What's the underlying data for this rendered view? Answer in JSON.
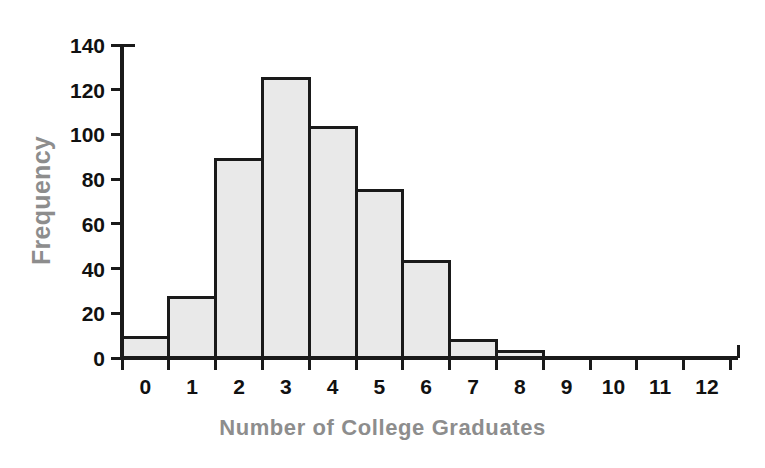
{
  "chart_data": {
    "type": "bar",
    "title": "",
    "subtitle": "",
    "xlabel": "Number of College Graduates",
    "ylabel": "Frequency",
    "categories": [
      "0",
      "1",
      "2",
      "3",
      "4",
      "5",
      "6",
      "7",
      "8",
      "9",
      "10",
      "11",
      "12"
    ],
    "values": [
      9,
      27,
      89,
      125,
      103,
      75,
      43,
      8,
      3,
      0,
      0,
      0,
      0
    ],
    "x_tick_labels": [
      "0",
      "1",
      "2",
      "3",
      "4",
      "5",
      "6",
      "7",
      "8",
      "9",
      "10",
      "11",
      "12"
    ],
    "y_tick_labels": [
      "0",
      "20",
      "40",
      "60",
      "80",
      "100",
      "120",
      "140"
    ],
    "y_tick_values": [
      0,
      20,
      40,
      60,
      80,
      100,
      120,
      140
    ],
    "ylim": [
      0,
      140
    ],
    "xlim": [
      -0.5,
      12.5
    ],
    "grid": false,
    "legend": false,
    "legend_position": "none",
    "bar_fill_color": "#e9e9e9",
    "bar_edge_color": "#1a1a1a",
    "axis_color": "#1a1a1a",
    "axis_title_color": "#8d8d8d",
    "tick_label_color": "#111111",
    "background_color": "#ffffff",
    "annotations": []
  }
}
